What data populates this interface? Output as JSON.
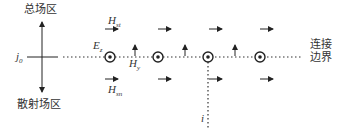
{
  "labels": {
    "total_field_region": "总场区",
    "scattered_field_region": "散射场区",
    "connecting_boundary_line1": "连接",
    "connecting_boundary_line2": "边界",
    "source": "j",
    "source_sub": "0",
    "ez": "E",
    "ez_sub": "z",
    "hy": "H",
    "hy_sub": "y",
    "h_total": "H",
    "h_total_sub": "st",
    "h_scattered": "H",
    "h_scattered_sub": "sn",
    "index": "i"
  },
  "geometry": {
    "ez_node_x": [
      110,
      158,
      208,
      260
    ],
    "hy_arrow_x": [
      135,
      185,
      235
    ],
    "h_arrow_x": [
      105,
      158,
      209,
      260
    ],
    "line_y": 57,
    "top_arrow_y": 29,
    "bottom_arrow_y": 79,
    "vertical_dotted_x": 208
  },
  "colors": {
    "ink": "#222222"
  }
}
